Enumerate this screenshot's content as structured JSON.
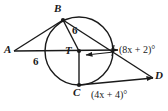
{
  "figure": {
    "type": "circle-geometry-diagram",
    "width": 168,
    "height": 111,
    "background_color": "#ffffff",
    "stroke_color": "#1a1a1a",
    "text_color": "#1a1a1a"
  },
  "points": [
    {
      "id": "A",
      "label": "A",
      "x": 14,
      "y": 51,
      "on_circle": false,
      "dot": false
    },
    {
      "id": "B",
      "label": "B",
      "x": 63,
      "y": 20,
      "on_circle": true,
      "dot": true
    },
    {
      "id": "T",
      "label": "T",
      "x": 79,
      "y": 51,
      "on_circle": false,
      "dot": true,
      "role": "center"
    },
    {
      "id": "C",
      "label": "C",
      "x": 79,
      "y": 85,
      "on_circle": true,
      "dot": true
    },
    {
      "id": "D",
      "label": "D",
      "x": 153,
      "y": 78,
      "on_circle": false,
      "dot": false
    }
  ],
  "circle": {
    "center_x": 79,
    "center_y": 51,
    "radius": 34
  },
  "segment_labels": [
    {
      "id": "AT-length",
      "text": "6",
      "x": 35,
      "y": 61,
      "segment": "A-T"
    },
    {
      "id": "BT-length",
      "text": "6",
      "x": 74,
      "y": 30,
      "segment": "B-T"
    }
  ],
  "angle_labels": [
    {
      "id": "angle-btd",
      "text": "(8x + 2)°",
      "x": 120,
      "y": 46,
      "vertex": "T"
    },
    {
      "id": "angle-cd",
      "text": "(4x + 4)°",
      "x": 92,
      "y": 91,
      "vertex": "C"
    }
  ],
  "point_labels": [
    {
      "id": "label-A",
      "text": "A",
      "x": 4,
      "y": 45
    },
    {
      "id": "label-B",
      "text": "B",
      "x": 54,
      "y": 4
    },
    {
      "id": "label-T",
      "text": "T",
      "x": 65,
      "y": 46
    },
    {
      "id": "label-C",
      "text": "C",
      "x": 73,
      "y": 88
    },
    {
      "id": "label-D",
      "text": "D",
      "x": 155,
      "y": 71
    }
  ]
}
